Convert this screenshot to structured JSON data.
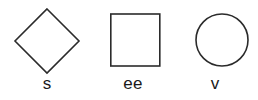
{
  "figure": {
    "name": "shape-label-figure",
    "background_color": "#ffffff",
    "stroke_color": "#2b2b2b",
    "text_color": "#1a1a1a",
    "stroke_width": 1.6,
    "width": 258,
    "height": 100
  },
  "shapes": [
    {
      "id": "diamond",
      "icon": "diamond-icon",
      "label": "s",
      "geometry": {
        "type": "polygon",
        "points": "47,9 79,41 47,73 15,41",
        "center_x": 47,
        "center_y": 41,
        "half_width": 32,
        "half_height": 32
      }
    },
    {
      "id": "square",
      "icon": "square-icon",
      "label": "ee",
      "geometry": {
        "type": "rect",
        "x": 110,
        "y": 14,
        "width": 49,
        "height": 52
      }
    },
    {
      "id": "circle",
      "icon": "circle-icon",
      "label": "v",
      "geometry": {
        "type": "circle",
        "cx": 222,
        "cy": 40,
        "r": 26
      }
    }
  ]
}
